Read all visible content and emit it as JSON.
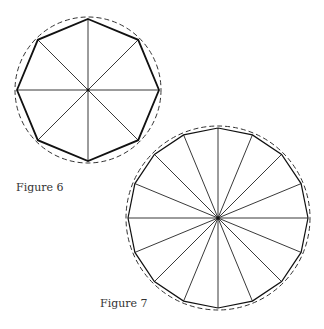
{
  "figures": [
    {
      "id": "figure-6",
      "caption": "Figure 6",
      "shape": "regular-octagon-inscribed-in-circle",
      "sides": 8,
      "center": [
        88,
        90
      ],
      "polygon_radius": 71,
      "circle_radius": 73,
      "rotation_deg": -90
    },
    {
      "id": "figure-7",
      "caption": "Figure 7",
      "shape": "regular-16-gon-inscribed-in-circle",
      "sides": 16,
      "center": [
        218,
        218
      ],
      "polygon_radius": 90,
      "circle_radius": 92,
      "rotation_deg": -90
    }
  ],
  "colors": {
    "polygon_stroke": "#111111",
    "spoke_stroke": "#222222",
    "circle_stroke": "#333333",
    "background": "#ffffff"
  }
}
